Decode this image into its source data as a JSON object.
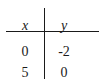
{
  "table": {
    "headers": [
      "x",
      "y"
    ],
    "rows": [
      [
        "0",
        "-2"
      ],
      [
        "5",
        "0"
      ]
    ]
  }
}
